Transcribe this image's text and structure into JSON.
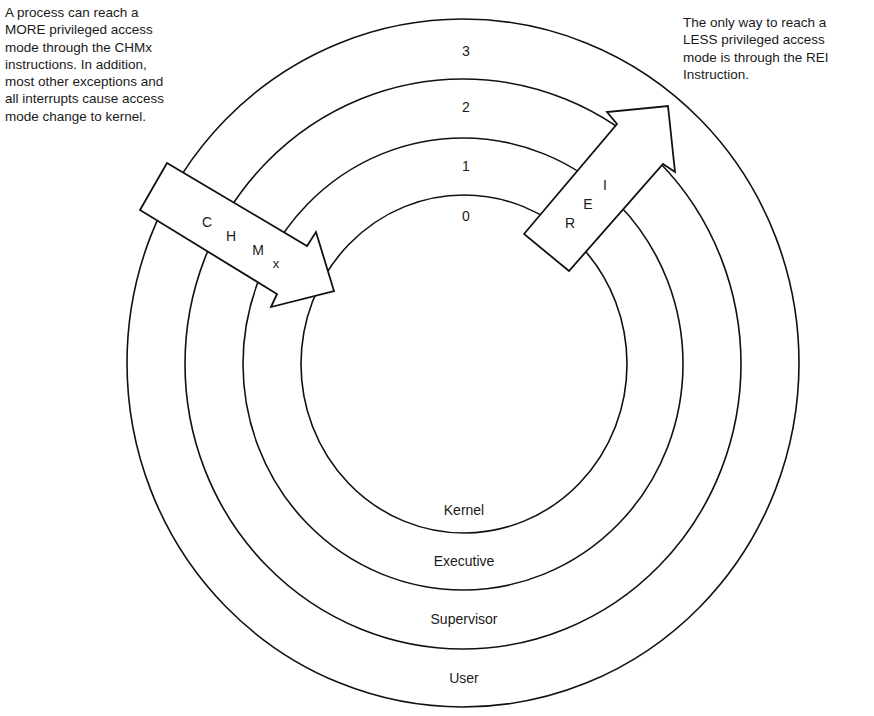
{
  "captions": {
    "left": "A process can reach a\nMORE privileged access\nmode through the CHMx\ninstructions. In addition,\nmost other exceptions and\nall interrupts cause access\nmode change to kernel.",
    "right": "The only way to reach a\nLESS privileged access\nmode is through the REI\nInstruction."
  },
  "rings": [
    {
      "number": "3",
      "mode": "User"
    },
    {
      "number": "2",
      "mode": "Supervisor"
    },
    {
      "number": "1",
      "mode": "Executive"
    },
    {
      "number": "0",
      "mode": "Kernel"
    }
  ],
  "arrows": {
    "chmx": {
      "letters": [
        "C",
        "H",
        "M",
        "x"
      ],
      "direction": "inward"
    },
    "rei": {
      "letters": [
        "R",
        "E",
        "I"
      ],
      "direction": "outward"
    }
  },
  "colors": {
    "stroke": "#111111",
    "background": "#ffffff",
    "text": "#1a1a1a"
  }
}
